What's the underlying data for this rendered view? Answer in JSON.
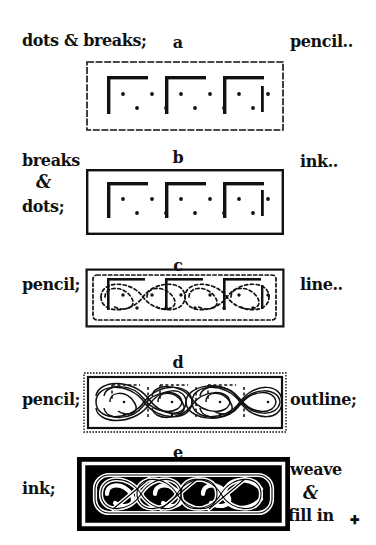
{
  "document": {
    "title": "Celtic knotwork construction steps",
    "background_color": "#ffffff",
    "ink_color": "#111111"
  },
  "steps": [
    {
      "id": "a",
      "letter": "a",
      "left_label": "dots & breaks;",
      "right_label": "pencil..",
      "medium": "pencil",
      "description": "dot grid with break marks, drawn in pencil",
      "style": "dotted-outline"
    },
    {
      "id": "b",
      "letter": "b",
      "left_label_lines": [
        "breaks",
        "&",
        "dots;"
      ],
      "right_label": "ink..",
      "medium": "ink",
      "description": "breaks and dots inked in",
      "style": "solid-outline"
    },
    {
      "id": "c",
      "letter": "c",
      "left_label": "pencil;",
      "right_label": "line..",
      "medium": "pencil",
      "description": "centre line of the weave drawn in pencil",
      "style": "dashed-curves"
    },
    {
      "id": "d",
      "letter": "d",
      "left_label": "pencil;",
      "right_label": "outline;",
      "medium": "pencil",
      "description": "band outlines drawn around the centre line",
      "style": "outlined-bands"
    },
    {
      "id": "e",
      "letter": "e",
      "left_label": "ink;",
      "right_label_lines": [
        "weave",
        "&",
        "fill in"
      ],
      "right_label_mark": "✚",
      "medium": "ink",
      "description": "finished knot inked, woven and filled in solid black",
      "style": "filled-black"
    }
  ],
  "colors": {
    "ink": "#111111",
    "paper": "#ffffff",
    "fill": "#000000"
  }
}
